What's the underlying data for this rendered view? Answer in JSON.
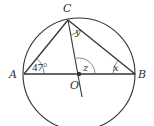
{
  "diagram": {
    "type": "circle-geometry",
    "colors": {
      "stroke": "#333333",
      "background": "#ffffff"
    },
    "circle": {
      "center_label": "O",
      "cx": 79,
      "cy": 74,
      "r": 56
    },
    "points": {
      "A": {
        "label": "A",
        "x": 24,
        "y": 74
      },
      "B": {
        "label": "B",
        "x": 135,
        "y": 74
      },
      "C": {
        "label": "C",
        "x": 68,
        "y": 20
      },
      "O": {
        "label": "O",
        "x": 79,
        "y": 74
      }
    },
    "segments": [
      "AB (diameter)",
      "AC",
      "BC",
      "CO extended"
    ],
    "angles": {
      "A": {
        "label": "47°",
        "value": "47",
        "unit": "°"
      },
      "B": {
        "label": "x"
      },
      "C": {
        "label": "y"
      },
      "O": {
        "label": "z"
      }
    }
  }
}
